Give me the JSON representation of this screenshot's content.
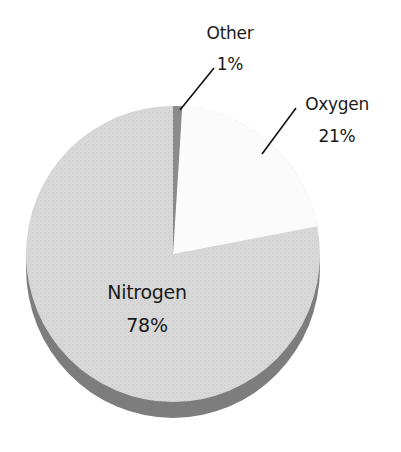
{
  "chart_data": {
    "type": "pie",
    "title": "",
    "categories": [
      "Nitrogen",
      "Oxygen",
      "Other"
    ],
    "values": [
      78,
      21,
      1
    ],
    "labels": [
      "78%",
      "21%",
      "1%"
    ],
    "colors": {
      "Nitrogen": "#d6d6d6",
      "Oxygen": "#fbfbfb",
      "Other": "#8a8a8a",
      "rim": "#7a7a7a"
    },
    "style": "3d-tilted",
    "legend": "none (inline labels with leader lines)"
  },
  "labels": {
    "other": {
      "name": "Other",
      "pct": "1%"
    },
    "oxygen": {
      "name": "Oxygen",
      "pct": "21%"
    },
    "nitrogen": {
      "name": "Nitrogen",
      "pct": "78%"
    }
  }
}
